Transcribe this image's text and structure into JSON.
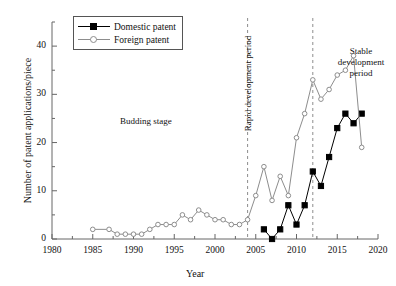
{
  "chart_data": {
    "type": "line",
    "title": "",
    "xlabel": "Year",
    "ylabel": "Number of patent applications/piece",
    "xlim": [
      1980,
      2020
    ],
    "ylim": [
      0,
      45
    ],
    "xticks": [
      1980,
      1985,
      1990,
      1995,
      2000,
      2005,
      2010,
      2015,
      2020
    ],
    "yticks": [
      0,
      10,
      20,
      30,
      40
    ],
    "yminorticks": [
      5,
      15,
      25,
      35,
      45
    ],
    "grid": false,
    "legend_position": "top-left",
    "series": [
      {
        "name": "Domestic patent",
        "color": "#000000",
        "marker": "filled-square",
        "x": [
          2006,
          2007,
          2008,
          2009,
          2010,
          2011,
          2012,
          2013,
          2014,
          2015,
          2016,
          2017,
          2018
        ],
        "values": [
          2,
          0,
          2,
          7,
          3,
          7,
          14,
          11,
          17,
          23,
          26,
          24,
          26
        ]
      },
      {
        "name": "Foreign patent",
        "color": "#8d8d8d",
        "marker": "open-circle",
        "x": [
          1985,
          1987,
          1988,
          1989,
          1990,
          1991,
          1992,
          1993,
          1994,
          1995,
          1996,
          1997,
          1998,
          1999,
          2000,
          2001,
          2002,
          2003,
          2004,
          2005,
          2006,
          2007,
          2008,
          2009,
          2010,
          2011,
          2012,
          2013,
          2014,
          2015,
          2016,
          2017,
          2018
        ],
        "values": [
          2,
          2,
          1,
          1,
          1,
          1,
          2,
          3,
          3,
          3,
          5,
          4,
          6,
          5,
          4,
          4,
          3,
          3,
          4,
          9,
          15,
          8,
          13,
          9,
          21,
          26,
          33,
          29,
          31,
          34,
          35,
          38,
          19
        ]
      }
    ],
    "annotations": [
      {
        "id": "budding",
        "text": "Budding stage",
        "rotation": 0
      },
      {
        "id": "rapid",
        "text": "Rapid development period",
        "rotation": -90
      },
      {
        "id": "stable",
        "text": "Stable development period",
        "rotation": 0
      }
    ],
    "dividers": [
      {
        "id": "divider-2004",
        "x": 2004,
        "style": "dashed"
      },
      {
        "id": "divider-2012",
        "x": 2012,
        "style": "dashed"
      }
    ]
  },
  "legend": {
    "items": [
      {
        "label": "Domestic patent",
        "marker": "filled-square",
        "color": "#000000"
      },
      {
        "label": "Foreign patent",
        "marker": "open-circle",
        "color": "#8d8d8d"
      }
    ]
  },
  "colors": {
    "domestic": "#000000",
    "foreign": "#8d8d8d",
    "axis": "#666666",
    "divider": "#8d8d8d"
  }
}
